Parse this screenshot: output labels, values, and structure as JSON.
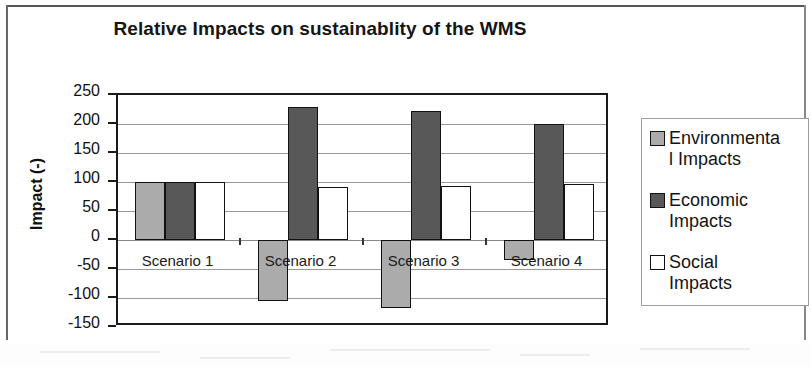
{
  "chart_data": {
    "type": "bar",
    "title": "Relative Impacts on sustainablity of the WMS",
    "xlabel": "",
    "ylabel": "Impact (-)",
    "categories": [
      "Scenario 1",
      "Scenario 2",
      "Scenario 3",
      "Scenario 4"
    ],
    "series": [
      {
        "name": "Environmental Impacts",
        "color": "#ababab",
        "values": [
          100,
          -106,
          -117,
          -34
        ]
      },
      {
        "name": "Economic Impacts",
        "color": "#585858",
        "values": [
          100,
          229,
          222,
          200
        ]
      },
      {
        "name": "Social Impacts",
        "color": "#ffffff",
        "values": [
          100,
          92,
          93,
          96
        ]
      }
    ],
    "ylim": [
      -150,
      250
    ],
    "ytick_labels": [
      "250",
      "200",
      "150",
      "100",
      "50",
      "0",
      "-50",
      "-100",
      "-150"
    ],
    "ytick_values": [
      250,
      200,
      150,
      100,
      50,
      0,
      -50,
      -100,
      -150
    ],
    "grid": true,
    "legend_position": "right"
  },
  "legend": {
    "entries": [
      {
        "label_line1": "Environmenta",
        "label_line2": "l Impacts",
        "swatch": "env"
      },
      {
        "label_line1": "Economic",
        "label_line2": "Impacts",
        "swatch": "econ"
      },
      {
        "label_line1": "Social",
        "label_line2": "Impacts",
        "swatch": "soc"
      }
    ]
  }
}
